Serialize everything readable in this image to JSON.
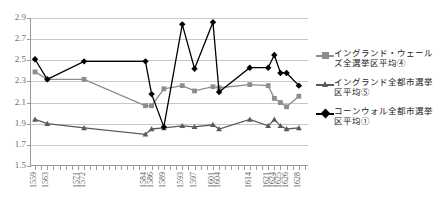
{
  "chart_data": {
    "type": "line",
    "title": "",
    "xlabel": "",
    "ylabel": "",
    "ylim": [
      1.5,
      2.9
    ],
    "ytick_values": [
      1.5,
      1.7,
      1.9,
      2.1,
      2.3,
      2.5,
      2.7,
      2.9
    ],
    "ytick_labels": [
      "1.5",
      "1.7",
      "1.9",
      "2.1",
      "2.3",
      "2.5",
      "2.7",
      "2.9"
    ],
    "grid": true,
    "legend_position": "right",
    "x_tick_count": 45,
    "categories": [
      "1559",
      "",
      "1563",
      "",
      "",
      "",
      "",
      "1571",
      "1572",
      "",
      "",
      "",
      "",
      "",
      "",
      "",
      "",
      "",
      "1584",
      "1586",
      "",
      "1589",
      "",
      "",
      "1593",
      "",
      "1597",
      "",
      "",
      "1601",
      "1604",
      "",
      "",
      "",
      "",
      "1614",
      "",
      "",
      "1621",
      "1624",
      "1625",
      "1626",
      "",
      "1628",
      ""
    ],
    "xtick_labels": [
      {
        "index": 0,
        "label": "1559"
      },
      {
        "index": 2,
        "label": "1563"
      },
      {
        "index": 7,
        "label": "1571"
      },
      {
        "index": 8,
        "label": "1572"
      },
      {
        "index": 18,
        "label": "1584"
      },
      {
        "index": 19,
        "label": "1586"
      },
      {
        "index": 21,
        "label": "1589"
      },
      {
        "index": 24,
        "label": "1593"
      },
      {
        "index": 26,
        "label": "1597"
      },
      {
        "index": 29,
        "label": "1601"
      },
      {
        "index": 30,
        "label": "1604"
      },
      {
        "index": 35,
        "label": "1614"
      },
      {
        "index": 38,
        "label": "1621"
      },
      {
        "index": 39,
        "label": "1624"
      },
      {
        "index": 40,
        "label": "1625"
      },
      {
        "index": 41,
        "label": "1626"
      },
      {
        "index": 43,
        "label": "1628"
      }
    ],
    "series": [
      {
        "name": "イングランド・ウェールズ全選挙区平均④",
        "key": "england-wales-all-constituencies",
        "color": "#8c8c8c",
        "marker": "square",
        "x": [
          0,
          2,
          8,
          18,
          19,
          21,
          24,
          26,
          29,
          30,
          35,
          38,
          39,
          40,
          41,
          43
        ],
        "values": [
          2.39,
          2.32,
          2.32,
          2.07,
          2.07,
          2.23,
          2.26,
          2.21,
          2.25,
          2.24,
          2.27,
          2.26,
          2.14,
          2.1,
          2.06,
          2.16
        ]
      },
      {
        "name": "イングランド全都市選挙区平均⑤",
        "key": "england-all-borough-constituencies",
        "color": "#5a5a5a",
        "marker": "triangle",
        "x": [
          0,
          2,
          8,
          18,
          19,
          21,
          24,
          26,
          29,
          30,
          35,
          38,
          39,
          40,
          41,
          43
        ],
        "values": [
          1.94,
          1.9,
          1.86,
          1.8,
          1.85,
          1.86,
          1.88,
          1.87,
          1.89,
          1.85,
          1.94,
          1.88,
          1.94,
          1.88,
          1.85,
          1.86
        ]
      },
      {
        "name": "コーンウォル全都市選挙区平均①",
        "key": "cornwall-all-borough-constituencies",
        "color": "#000000",
        "marker": "diamond",
        "x": [
          0,
          2,
          8,
          18,
          19,
          21,
          24,
          26,
          29,
          30,
          35,
          38,
          39,
          40,
          41,
          43
        ],
        "values": [
          2.51,
          2.32,
          2.49,
          2.49,
          2.18,
          1.87,
          2.84,
          2.42,
          2.86,
          2.2,
          2.43,
          2.43,
          2.55,
          2.38,
          2.38,
          2.26
        ]
      }
    ]
  },
  "legend": {
    "items": [
      {
        "label": "イングランド・ウェールズ全選挙区平均④"
      },
      {
        "label": "イングランド全都市選挙区平均⑤"
      },
      {
        "label": "コーンウォル全都市選挙区平均①"
      }
    ]
  }
}
